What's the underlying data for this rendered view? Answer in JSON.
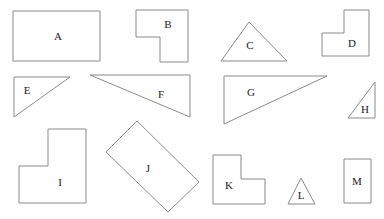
{
  "canvas": {
    "width": 384,
    "height": 219,
    "background_color": "#ffffff",
    "outline_color": "#8a8a8a",
    "label_color": "#1a1a1a",
    "title": "Geometric shapes figure"
  },
  "shapes": [
    {
      "id": "A",
      "label": "A",
      "kind": "rectangle",
      "points": "13,11 100,11 100,61 13,61",
      "label_x": 58,
      "label_y": 37
    },
    {
      "id": "B",
      "label": "B",
      "kind": "l-shape",
      "points": "136,10 188,10 188,62 160,62 160,37 136,37",
      "label_x": 168,
      "label_y": 25
    },
    {
      "id": "C",
      "label": "C",
      "kind": "triangle",
      "points": "249,22 287,61 221,61",
      "label_x": 250,
      "label_y": 46
    },
    {
      "id": "D",
      "label": "D",
      "kind": "l-shape",
      "points": "344,10 369,10 369,56 322,56 322,33 344,33",
      "label_x": 352,
      "label_y": 44
    },
    {
      "id": "E",
      "label": "E",
      "kind": "right-triangle",
      "points": "14,77 70,77 14,117",
      "label_x": 27,
      "label_y": 91
    },
    {
      "id": "F",
      "label": "F",
      "kind": "right-triangle",
      "points": "90,75 190,75 190,117",
      "label_x": 161,
      "label_y": 95
    },
    {
      "id": "G",
      "label": "G",
      "kind": "right-triangle",
      "points": "224,76 327,76 224,124",
      "label_x": 251,
      "label_y": 93
    },
    {
      "id": "H",
      "label": "H",
      "kind": "right-triangle",
      "points": "375,82 375,118 348,118",
      "label_x": 365,
      "label_y": 110
    },
    {
      "id": "I",
      "label": "I",
      "kind": "l-shape",
      "points": "48,129 86,129 86,203 19,203 19,166 48,166",
      "label_x": 60,
      "label_y": 183
    },
    {
      "id": "J",
      "label": "J",
      "kind": "rotated-rectangle",
      "points": "137,121 199,182 168,212 106,152",
      "label_x": 148,
      "label_y": 169
    },
    {
      "id": "K",
      "label": "K",
      "kind": "l-shape",
      "points": "213,155 241,155 241,179 265,179 265,204 213,204",
      "label_x": 229,
      "label_y": 186
    },
    {
      "id": "L",
      "label": "L",
      "kind": "triangle",
      "points": "301,178 315,204 288,204",
      "label_x": 301,
      "label_y": 196
    },
    {
      "id": "M",
      "label": "M",
      "kind": "rectangle",
      "points": "344,159 371,159 371,203 344,203",
      "label_x": 357,
      "label_y": 182
    }
  ]
}
